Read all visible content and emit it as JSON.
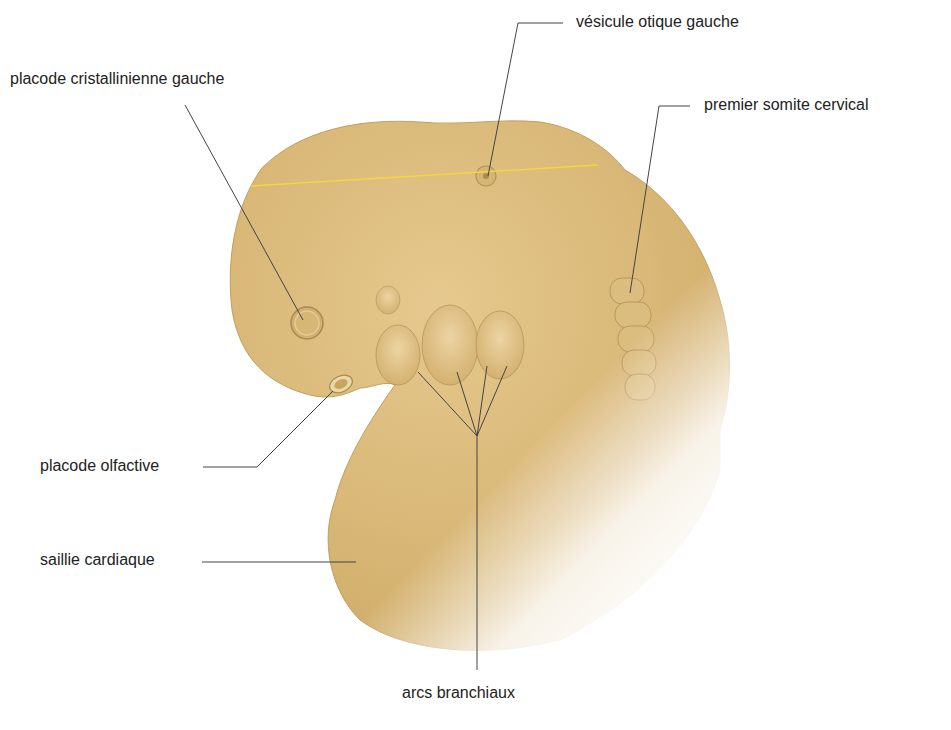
{
  "figure": {
    "colors": {
      "body": "#d9b878",
      "body_light": "#ead3a0",
      "body_shadow": "#c9a560",
      "outline": "#b8965a",
      "leader_line": "#444444",
      "plane_line": "#f2d640",
      "label_text": "#222222"
    }
  },
  "labels": {
    "placode_cristallinienne": "placode cristallinienne gauche",
    "vesicule_otique": "vésicule otique gauche",
    "premier_somite": "premier somite cervical",
    "placode_olfactive": "placode olfactive",
    "saillie_cardiaque": "saillie cardiaque",
    "arcs_branchiaux": "arcs branchiaux"
  }
}
